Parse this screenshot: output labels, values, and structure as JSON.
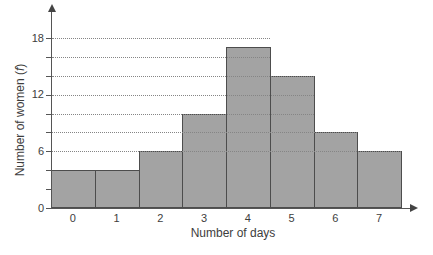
{
  "chart_data": {
    "type": "bar",
    "subtype": "histogram-contiguous-bars",
    "title": "",
    "xlabel": "Number of days",
    "ylabel": "Number of women (f)",
    "ylabel_parts": {
      "prefix": "Number of women (",
      "italic": "f",
      "suffix": ")"
    },
    "categories": [
      "0",
      "1",
      "2",
      "3",
      "4",
      "5",
      "6",
      "7"
    ],
    "values": [
      4,
      4,
      6,
      10,
      17,
      14,
      8,
      6
    ],
    "ylim": [
      0,
      19
    ],
    "ytick_labeled_values": [
      0,
      6,
      12,
      18
    ],
    "ytick_minor_values": [
      2,
      4,
      6,
      8,
      10,
      12,
      14,
      16,
      18
    ],
    "gridline_values": [
      6,
      8,
      10,
      12,
      14,
      16,
      18
    ],
    "gridline_rule": "dotted line from y-axis to right edge of rightmost bar reaching that value",
    "grid_style": "dotted",
    "legend": "none",
    "axes_have_arrowheads": true
  },
  "colors": {
    "background": "#ffffff",
    "bar_fill": "#a3a3a3",
    "bar_border": "#4d4d4d",
    "axis": "#555555",
    "grid": "#858585",
    "text": "#3d3d3d"
  }
}
